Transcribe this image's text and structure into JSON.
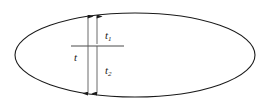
{
  "figure": {
    "type": "technical-diagram",
    "background_color": "#ffffff",
    "stroke_color": "#1a1a1a",
    "ellipse": {
      "center_x": 135,
      "center_y": 55,
      "radius_x": 120,
      "radius_y": 42,
      "stroke_width": 1.1
    },
    "reference_line": {
      "name": "mid-plane-line",
      "x1": 71,
      "x2": 124,
      "y": 46,
      "stroke_width": 1
    },
    "dimensions": [
      {
        "id": "t",
        "label": "t",
        "subscript": "",
        "x": 88,
        "y_top": 13,
        "y_bottom": 97,
        "label_x": 74,
        "label_y": 52,
        "arrow": "double"
      },
      {
        "id": "t1",
        "label": "t",
        "subscript": "1",
        "x": 97,
        "y_top": 13,
        "y_bottom": 46,
        "label_x": 105,
        "label_y": 30,
        "arrow": "double"
      },
      {
        "id": "t2",
        "label": "t",
        "subscript": "2",
        "x": 97,
        "y_top": 46,
        "y_bottom": 97,
        "label_x": 105,
        "label_y": 65,
        "arrow": "double"
      }
    ]
  }
}
